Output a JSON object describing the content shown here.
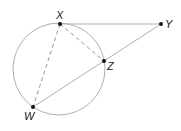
{
  "diagram": {
    "points": {
      "X": {
        "label": "X"
      },
      "Y": {
        "label": "Y"
      },
      "Z": {
        "label": "Z"
      },
      "W": {
        "label": "W"
      }
    },
    "segments": [
      {
        "from": "X",
        "to": "Y",
        "style": "solid"
      },
      {
        "from": "W",
        "to": "Y",
        "style": "solid"
      },
      {
        "from": "X",
        "to": "Z",
        "style": "dashed"
      },
      {
        "from": "X",
        "to": "W",
        "style": "dashed"
      }
    ],
    "circle": {
      "through": [
        "X",
        "Z",
        "W"
      ]
    },
    "colors": {
      "line": "#b0b0b0",
      "point": "#111111",
      "dashed": "#999999"
    }
  }
}
